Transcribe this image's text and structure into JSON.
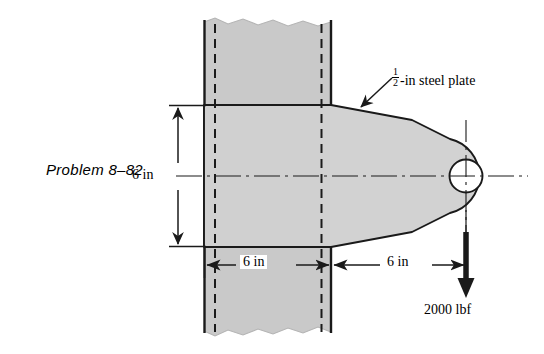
{
  "figure": {
    "problem_label": "Problem 8–82",
    "annotations": {
      "plate_note_fraction_numerator": "1",
      "plate_note_fraction_denominator": "2",
      "plate_note_text": "-in steel plate",
      "force_label": "2000 lbf"
    },
    "dimensions": [
      {
        "name": "plate-height",
        "label": "6 in",
        "orientation": "vertical"
      },
      {
        "name": "embedded-length",
        "label": "6 in",
        "orientation": "horizontal"
      },
      {
        "name": "overhang-length",
        "label": "6 in",
        "orientation": "horizontal"
      }
    ],
    "colors": {
      "wall_fill": "#c9c9c9",
      "plate_fill": "#d2d2d2",
      "line": "#1a1a1a",
      "background": "#ffffff"
    }
  }
}
